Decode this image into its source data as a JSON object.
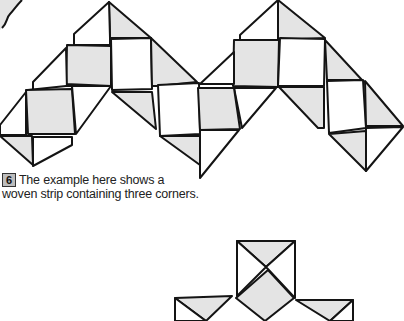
{
  "figure": {
    "title": "Woven strip containing three corners",
    "colors": {
      "stroke": "#141414",
      "shaded": "#e4e4e4",
      "plain": "#ffffff"
    }
  },
  "caption": {
    "step_number": "6",
    "text": "The example here shows a woven strip containing three corners."
  }
}
